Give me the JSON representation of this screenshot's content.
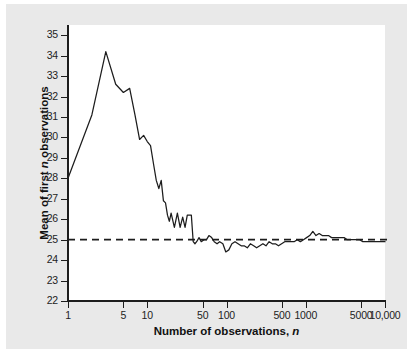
{
  "figure": {
    "background_color": "#e9e9e9",
    "plot_background_color": "#ffffff",
    "axis_color": "#1d1d1d",
    "series_color": "#1d1d1d"
  },
  "chart_data": {
    "type": "line",
    "title": "",
    "subtitle": "",
    "xlabel": "Number of observations, n",
    "xlabel_plain": "Number of observations,",
    "xlabel_italic": "n",
    "ylabel": "Mean of first n observations",
    "ylabel_part1": "Mean of first",
    "ylabel_italic": "n",
    "ylabel_part2": "observations",
    "xscale": "log",
    "yscale": "linear",
    "xlim": [
      1,
      10000
    ],
    "ylim": [
      22,
      35.5
    ],
    "grid": false,
    "legend": null,
    "x_tick_labels": [
      "1",
      "5",
      "10",
      "50",
      "100",
      "500",
      "1000",
      "5000",
      "10,000"
    ],
    "x_tick_values": [
      1,
      5,
      10,
      50,
      100,
      500,
      1000,
      5000,
      10000
    ],
    "y_tick_labels": [
      "22",
      "23",
      "24",
      "25",
      "26",
      "27",
      "28",
      "29",
      "30",
      "31",
      "32",
      "33",
      "34",
      "35"
    ],
    "y_tick_values": [
      22,
      23,
      24,
      25,
      26,
      27,
      28,
      29,
      30,
      31,
      32,
      33,
      34,
      35
    ],
    "reference_line": {
      "name": "population-mean",
      "y": 25,
      "style": "dashed",
      "label": ""
    },
    "series": [
      {
        "name": "running-mean",
        "style": "solid",
        "x": [
          1,
          2,
          3,
          4,
          5,
          6,
          7,
          8,
          9,
          10,
          11,
          12,
          13,
          14,
          15,
          16,
          17,
          18,
          19,
          20,
          22,
          24,
          26,
          28,
          30,
          32,
          34,
          36,
          38,
          40,
          42,
          45,
          48,
          52,
          56,
          60,
          65,
          70,
          76,
          82,
          90,
          98,
          107,
          117,
          128,
          140,
          153,
          167,
          183,
          200,
          220,
          240,
          263,
          288,
          315,
          345,
          378,
          414,
          453,
          496,
          543,
          595,
          651,
          713,
          781,
          855,
          936,
          1025,
          1122,
          1229,
          1346,
          1474,
          1614,
          1767,
          1935,
          2119,
          2320,
          2541,
          2782,
          3047,
          3336,
          3653,
          4000,
          4380,
          4797,
          5253,
          5752,
          6298,
          6897,
          7552,
          8270,
          9055,
          10000
        ],
        "y": [
          28.0,
          31.1,
          34.2,
          32.6,
          32.2,
          32.4,
          31.1,
          29.9,
          30.1,
          29.8,
          29.6,
          28.7,
          27.9,
          27.5,
          27.9,
          26.9,
          26.8,
          26.2,
          25.9,
          26.3,
          25.6,
          26.3,
          25.6,
          26.1,
          25.6,
          26.2,
          26.2,
          26.2,
          24.9,
          24.8,
          24.9,
          25.1,
          24.9,
          25.0,
          25.0,
          25.2,
          25.1,
          24.9,
          24.8,
          24.9,
          24.8,
          24.4,
          24.5,
          24.8,
          24.9,
          24.8,
          24.7,
          24.7,
          24.6,
          24.8,
          24.7,
          24.6,
          24.7,
          24.8,
          24.7,
          24.9,
          24.8,
          24.8,
          24.7,
          24.8,
          24.9,
          24.9,
          24.9,
          24.9,
          25.0,
          24.9,
          25.0,
          25.1,
          25.2,
          25.4,
          25.2,
          25.3,
          25.2,
          25.2,
          25.2,
          25.1,
          25.1,
          25.1,
          25.1,
          25.1,
          25.0,
          25.0,
          25.0,
          25.0,
          25.0,
          24.9,
          24.9,
          24.9,
          24.9,
          24.9,
          24.9,
          24.9,
          24.9
        ]
      }
    ]
  }
}
